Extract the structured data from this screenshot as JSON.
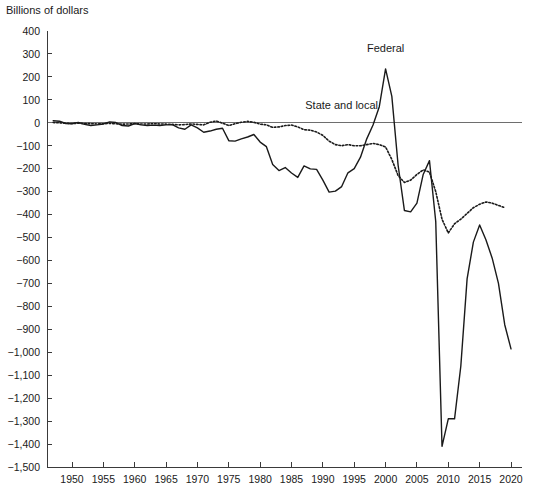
{
  "chart_data": {
    "type": "line",
    "title": "",
    "ylabel": "Billions of dollars",
    "xlabel": "",
    "ylim": [
      -1500,
      400
    ],
    "xlim": [
      1946,
      2021
    ],
    "ytick_step": 100,
    "xtick_step": 5,
    "grid": false,
    "legend": "inline-annotations",
    "ytick_labels": [
      "400",
      "300",
      "200",
      "100",
      "0",
      "−100",
      "−200",
      "−300",
      "−400",
      "−500",
      "−600",
      "−700",
      "−800",
      "−900",
      "−1,000",
      "−1,100",
      "−1,200",
      "−1,300",
      "−1,400",
      "−1,500"
    ],
    "ytick_values": [
      400,
      300,
      200,
      100,
      0,
      -100,
      -200,
      -300,
      -400,
      -500,
      -600,
      -700,
      -800,
      -900,
      -1000,
      -1100,
      -1200,
      -1300,
      -1400,
      -1500
    ],
    "xtick_labels": [
      "1950",
      "1955",
      "1960",
      "1965",
      "1970",
      "1975",
      "1980",
      "1985",
      "1990",
      "1995",
      "2000",
      "2005",
      "2010",
      "2015",
      "2020"
    ],
    "xtick_values": [
      1950,
      1955,
      1960,
      1965,
      1970,
      1975,
      1980,
      1985,
      1990,
      1995,
      2000,
      2005,
      2010,
      2015,
      2020
    ],
    "annotations": [
      {
        "text": "Federal",
        "x": 2000,
        "y": 310,
        "series": "Federal"
      },
      {
        "text": "State and local",
        "x": 1993,
        "y": 60,
        "series": "State and local"
      }
    ],
    "series": [
      {
        "name": "Federal",
        "style": "solid",
        "color": "#1a1a1a",
        "x": [
          1947,
          1948,
          1949,
          1950,
          1951,
          1952,
          1953,
          1954,
          1955,
          1956,
          1957,
          1958,
          1959,
          1960,
          1961,
          1962,
          1963,
          1964,
          1965,
          1966,
          1967,
          1968,
          1969,
          1970,
          1971,
          1972,
          1973,
          1974,
          1975,
          1976,
          1977,
          1978,
          1979,
          1980,
          1981,
          1982,
          1983,
          1984,
          1985,
          1986,
          1987,
          1988,
          1989,
          1990,
          1991,
          1992,
          1993,
          1994,
          1995,
          1996,
          1997,
          1998,
          1999,
          2000,
          2001,
          2002,
          2003,
          2004,
          2005,
          2006,
          2007,
          2008,
          2009,
          2010,
          2011,
          2012,
          2013,
          2014,
          2015,
          2016,
          2017,
          2018,
          2019,
          2020
        ],
        "values": [
          9,
          7,
          -3,
          -4,
          2,
          -7,
          -12,
          -9,
          -5,
          4,
          1,
          -12,
          -14,
          -3,
          -9,
          -12,
          -10,
          -12,
          -9,
          -8,
          -22,
          -28,
          -9,
          -22,
          -41,
          -36,
          -28,
          -24,
          -78,
          -80,
          -70,
          -62,
          -51,
          -84,
          -104,
          -182,
          -208,
          -195,
          -219,
          -238,
          -188,
          -201,
          -203,
          -250,
          -302,
          -298,
          -278,
          -218,
          -200,
          -150,
          -70,
          -10,
          70,
          235,
          115,
          -185,
          -382,
          -388,
          -350,
          -225,
          -165,
          -430,
          -1410,
          -1290,
          -1290,
          -1060,
          -680,
          -520,
          -445,
          -510,
          -590,
          -700,
          -880,
          -985
        ]
      },
      {
        "name": "State and local",
        "style": "dotted",
        "color": "#1a1a1a",
        "x": [
          1947,
          1948,
          1949,
          1950,
          1951,
          1952,
          1953,
          1954,
          1955,
          1956,
          1957,
          1958,
          1959,
          1960,
          1961,
          1962,
          1963,
          1964,
          1965,
          1966,
          1967,
          1968,
          1969,
          1970,
          1971,
          1972,
          1973,
          1974,
          1975,
          1976,
          1977,
          1978,
          1979,
          1980,
          1981,
          1982,
          1983,
          1984,
          1985,
          1986,
          1987,
          1988,
          1989,
          1990,
          1991,
          1992,
          1993,
          1994,
          1995,
          1996,
          1997,
          1998,
          1999,
          2000,
          2001,
          2002,
          2003,
          2004,
          2005,
          2006,
          2007,
          2008,
          2009,
          2010,
          2011,
          2012,
          2013,
          2014,
          2015,
          2016,
          2017,
          2018,
          2019
        ],
        "values": [
          1,
          0,
          -2,
          -3,
          -2,
          -3,
          -4,
          -5,
          -4,
          -3,
          -4,
          -6,
          -5,
          -4,
          -5,
          -5,
          -4,
          -5,
          -6,
          -7,
          -9,
          -8,
          -5,
          -7,
          -9,
          2,
          8,
          -2,
          -12,
          -4,
          2,
          6,
          2,
          -6,
          -9,
          -20,
          -18,
          -12,
          -10,
          -18,
          -30,
          -32,
          -40,
          -55,
          -80,
          -95,
          -100,
          -95,
          -100,
          -100,
          -95,
          -90,
          -95,
          -105,
          -160,
          -230,
          -260,
          -250,
          -225,
          -205,
          -215,
          -300,
          -420,
          -480,
          -440,
          -420,
          -395,
          -370,
          -355,
          -345,
          -350,
          -360,
          -370
        ]
      }
    ]
  }
}
